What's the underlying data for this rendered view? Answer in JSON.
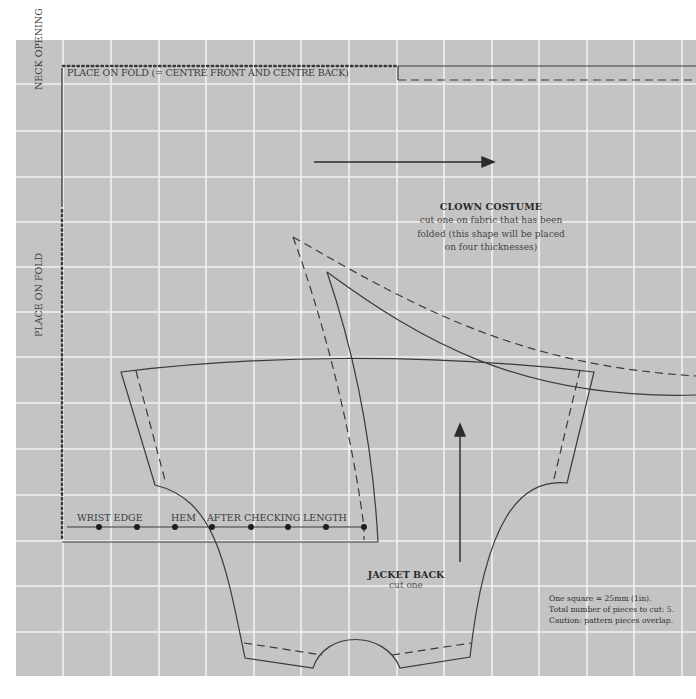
{
  "pattern": {
    "fold_label_top": "PLACE ON FOLD (= CENTRE FRONT AND CENTRE BACK)",
    "neck_opening_label": "NECK OPENING",
    "fold_label_side": "PLACE ON FOLD",
    "edge_labels": [
      "WRIST EDGE",
      "HEM",
      "AFTER CHECKING",
      "LENGTH"
    ],
    "clown_costume": {
      "title": "CLOWN COSTUME",
      "lines": [
        "cut one on fabric that has been",
        "folded (this shape will be placed",
        "on four thicknesses)"
      ]
    },
    "jacket_back": {
      "title": "JACKET BACK",
      "subtitle": "cut one"
    },
    "notes": [
      "One square = 25mm (1in).",
      "Total number of pieces to cut: 5.",
      "Caution: pattern pieces overlap."
    ],
    "colors": {
      "background": "#c4c4c4",
      "grid": "#f2f2f2",
      "line": "#3a3a3a"
    },
    "grid_square": "25mm (1in)"
  }
}
